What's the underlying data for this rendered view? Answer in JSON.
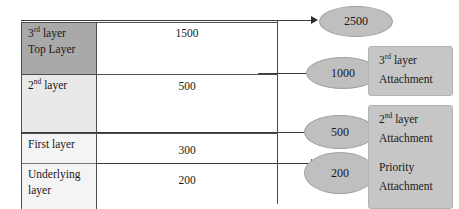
{
  "diagram": {
    "table": {
      "rows": [
        {
          "label_line1": "3",
          "label_sup1": "rd",
          "label_rest1": " layer",
          "label_line2": "Top Layer",
          "value": "1500",
          "shade": "dark"
        },
        {
          "label_line1": "2",
          "label_sup1": "nd",
          "label_rest1": " layer",
          "label_line2": "",
          "value": "500",
          "shade": "light"
        },
        {
          "label_line1": "First layer",
          "label_sup1": "",
          "label_rest1": "",
          "label_line2": "",
          "value": "300",
          "shade": "pale"
        },
        {
          "label_line1": "Underlying",
          "label_sup1": "",
          "label_rest1": "",
          "label_line2": "layer",
          "value": "200",
          "shade": "pale"
        }
      ]
    },
    "nodes": [
      {
        "value": "2500"
      },
      {
        "value": "1000"
      },
      {
        "value": "500"
      },
      {
        "value": "200"
      }
    ],
    "attachments": [
      {
        "line1_num": "3",
        "line1_sup": "rd",
        "line1_rest": " layer",
        "line2": "Attachment"
      },
      {
        "line1_num": "2",
        "line1_sup": "nd",
        "line1_rest": " layer",
        "line2": "Attachment"
      },
      {
        "line1_num": "",
        "line1_sup": "",
        "line1_rest": "Priority",
        "line2": "Attachment"
      }
    ],
    "colors": {
      "shade_dark": "#a9a9a9",
      "shade_light": "#e9e9e9",
      "ellipse_fill": "#bfbfbf",
      "box_fill": "#c6c6c6",
      "line": "#4d4d4d"
    }
  }
}
